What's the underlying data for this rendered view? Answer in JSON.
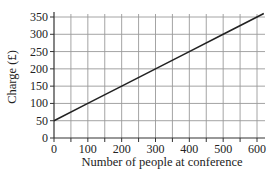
{
  "chart_data": {
    "type": "line",
    "title": "",
    "xlabel": "Number of people at conference",
    "ylabel": "Charge (£)",
    "xlim": [
      0,
      600
    ],
    "ylim": [
      0,
      350
    ],
    "x_ticks": [
      0,
      100,
      200,
      300,
      400,
      500,
      600
    ],
    "y_ticks": [
      0,
      50,
      100,
      150,
      200,
      250,
      300,
      350
    ],
    "x_minor_step": 50,
    "grid": true,
    "legend": null,
    "series": [
      {
        "name": "Charge",
        "color": "#222222",
        "x": [
          0,
          100,
          200,
          300,
          400,
          500,
          600,
          620
        ],
        "y": [
          50,
          100,
          150,
          200,
          250,
          300,
          350,
          360
        ]
      }
    ]
  },
  "colors": {
    "grid": "#9a9a9a",
    "axis": "#333333",
    "line": "#222222",
    "background": "#ffffff"
  }
}
